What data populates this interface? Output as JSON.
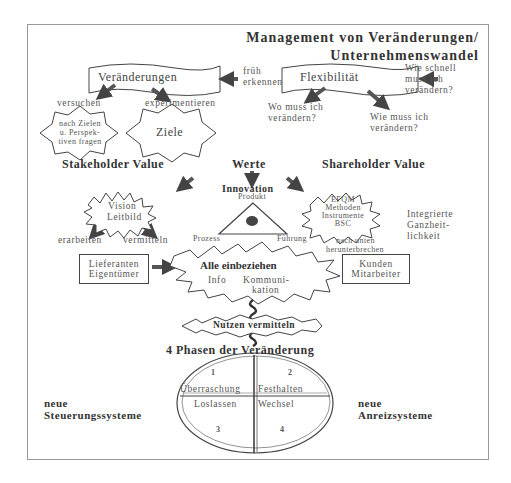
{
  "title": {
    "line1": "Management von Veränderungen/",
    "line2": "Unternehmenswandel"
  },
  "left_top": {
    "banner": "Veränderungen",
    "note_l1": "früh",
    "note_l2": "erkennen",
    "out_left": "versuchen",
    "out_right": "experimentieren"
  },
  "right_top": {
    "banner": "Flexibilität",
    "note_l1": "Wie schnell",
    "note_l2": "muss ich",
    "note_l3": "verändern?",
    "out_left_l1": "Wo muss ich",
    "out_left_l2": "verändern?",
    "out_right_l1": "Wie muss ich",
    "out_right_l2": "verändern?"
  },
  "stars_row": {
    "star1_l1": "nach Zielen",
    "star1_l2": "u. Perspek-",
    "star1_l3": "tiven fragen",
    "star2": "Ziele"
  },
  "values": {
    "stakeholder": "Stakeholder Value",
    "werte": "Werte",
    "shareholder": "Shareholder Value"
  },
  "innovation": {
    "label": "Innovation",
    "top": "Produkt",
    "left": "Prozess",
    "right": "Führung"
  },
  "vision": {
    "l1": "Vision",
    "l2": "Leitbild",
    "out_left": "erarbeiten",
    "out_right": "vermitteln"
  },
  "efqm": {
    "l1": "EFQM",
    "l2": "Methoden",
    "l3": "Instrumente",
    "l4": "BSC",
    "below_l1": "nach unten",
    "below_l2": "herunterbrechen",
    "side_l1": "Integrierte",
    "side_l2": "Ganzheit-",
    "side_l3": "lichkeit"
  },
  "center": {
    "left_box_l1": "Lieferanten",
    "left_box_l2": "Eigentümer",
    "main": "Alle einbeziehen",
    "info": "Info",
    "komm_l1": "Kommuni-",
    "komm_l2": "kation",
    "right_box_l1": "Kunden",
    "right_box_l2": "Mitarbeiter",
    "nutzen": "Nutzen vermitteln"
  },
  "phases": {
    "heading": "4 Phasen der Veränderung",
    "q1_num": "1",
    "q2_num": "2",
    "q3_num": "3",
    "q4_num": "4",
    "q1": "Überraschung",
    "q2": "Festhalten",
    "q3": "Loslassen",
    "q4": "Wechsel",
    "left_l1": "neue",
    "left_l2": "Steuerungssysteme",
    "right_l1": "neue",
    "right_l2": "Anreizsysteme"
  }
}
